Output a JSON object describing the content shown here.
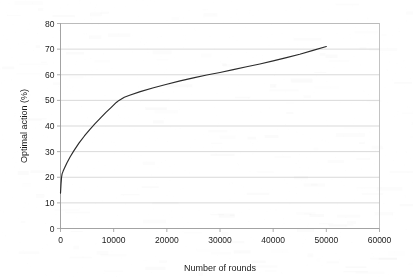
{
  "chart_data": {
    "type": "line",
    "title": "",
    "xlabel": "Number of rounds",
    "ylabel": "Optimal action (%)",
    "xlim": [
      0,
      60000
    ],
    "ylim": [
      0,
      80
    ],
    "xticks": [
      0,
      10000,
      20000,
      30000,
      40000,
      50000,
      60000
    ],
    "yticks": [
      0,
      10,
      20,
      30,
      40,
      50,
      60,
      70,
      80
    ],
    "xtick_labels": [
      "0",
      "10000",
      "20000",
      "30000",
      "40000",
      "50000",
      "60000"
    ],
    "ytick_labels": [
      "0",
      "10",
      "20",
      "30",
      "40",
      "50",
      "60",
      "70",
      "80"
    ],
    "grid": {
      "horizontal": true,
      "vertical": false
    },
    "legend": {
      "visible": false,
      "position": "none"
    },
    "series": [
      {
        "name": "optimal action",
        "color": "#2b2b2b",
        "x": [
          0,
          100,
          200,
          300,
          500,
          800,
          1200,
          1800,
          2500,
          3500,
          4500,
          5500,
          6500,
          7500,
          8500,
          9500,
          10500,
          11000,
          12000,
          13000,
          15000,
          17500,
          20000,
          22500,
          25000,
          27500,
          30000,
          32500,
          35000,
          37500,
          40000,
          42500,
          45000,
          47500,
          50000
        ],
        "y": [
          13.8,
          17.5,
          20.0,
          21.3,
          22.4,
          23.8,
          25.6,
          27.9,
          30.3,
          33.4,
          36.1,
          38.6,
          40.9,
          43.1,
          45.2,
          47.2,
          49.2,
          50.0,
          51.2,
          52.0,
          53.4,
          54.9,
          56.3,
          57.6,
          58.8,
          59.9,
          60.9,
          62.0,
          63.1,
          64.2,
          65.4,
          66.7,
          68.0,
          69.5,
          71.0
        ]
      }
    ]
  },
  "axes": {
    "x_title": "Number of rounds",
    "y_title": "Optimal action (%)"
  }
}
